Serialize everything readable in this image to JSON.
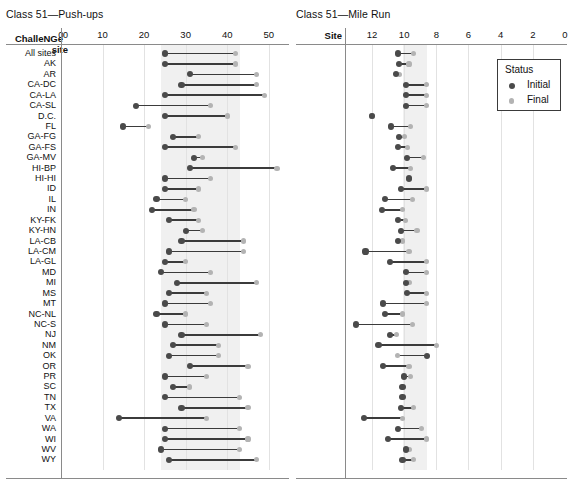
{
  "chart_data": [
    {
      "type": "dumbbell",
      "title": "Class 51—Push-ups",
      "ylabel": "ChalleNGe site",
      "xlabel": "",
      "xticks": [
        0,
        10,
        20,
        30,
        40,
        50
      ],
      "xlim": [
        0,
        55
      ],
      "reversed": false,
      "band": [
        24,
        43
      ],
      "grid": true,
      "legend": {
        "position": "none"
      },
      "series": [
        {
          "name": "Initial",
          "color": "#4a4a4a"
        },
        {
          "name": "Final",
          "color": "#b3b3b3"
        }
      ],
      "categories": [
        "All sites",
        "AK",
        "AR",
        "CA-DC",
        "CA-LA",
        "CA-SL",
        "D.C.",
        "FL",
        "GA-FG",
        "GA-FS",
        "GA-MV",
        "HI-BP",
        "HI-HI",
        "ID",
        "IL",
        "IN",
        "KY-FK",
        "KY-HN",
        "LA-CB",
        "LA-CM",
        "LA-GL",
        "MD",
        "MI",
        "MS",
        "MT",
        "NC-NL",
        "NC-S",
        "NJ",
        "NM",
        "OK",
        "OR",
        "PR",
        "SC",
        "TN",
        "TX",
        "VA",
        "WA",
        "WI",
        "WV",
        "WY"
      ],
      "initial": [
        25,
        25,
        31,
        29,
        25,
        18,
        25,
        15,
        27,
        25,
        32,
        31,
        25,
        25,
        23,
        22,
        26,
        30,
        29,
        26,
        25,
        24,
        28,
        26,
        25,
        23,
        25,
        29,
        27,
        26,
        31,
        25,
        27,
        25,
        29,
        14,
        25,
        25,
        24,
        26
      ],
      "final": [
        42,
        42,
        47,
        47,
        49,
        36,
        40,
        21,
        33,
        42,
        34,
        52,
        36,
        33,
        30,
        32,
        33,
        34,
        44,
        44,
        30,
        36,
        47,
        35,
        36,
        30,
        35,
        48,
        38,
        38,
        45,
        35,
        31,
        43,
        45,
        35,
        43,
        45,
        43,
        47
      ]
    },
    {
      "type": "dumbbell",
      "title": "Class 51—Mile Run",
      "ylabel": "Site",
      "xlabel": "",
      "xticks": [
        12,
        10,
        8,
        6,
        4,
        2,
        0
      ],
      "xlim": [
        13,
        0
      ],
      "reversed": true,
      "band": [
        10.1,
        8.6
      ],
      "grid": true,
      "legend": {
        "position": "top-right",
        "title": "Status",
        "items": [
          "Initial",
          "Final"
        ]
      },
      "categories": [
        "All sites",
        "AK",
        "AR",
        "CA-DC",
        "CA-LA",
        "CA-SL",
        "D.C.",
        "FL",
        "GA-FG",
        "GA-FS",
        "GA-MV",
        "HI-BP",
        "HI-HI",
        "ID",
        "IL",
        "IN",
        "KY-FK",
        "KY-HN",
        "LA-CB",
        "LA-CM",
        "LA-GL",
        "MD",
        "MI",
        "MS",
        "MT",
        "NC-NL",
        "NC-S",
        "NJ",
        "NM",
        "OK",
        "OR",
        "PR",
        "SC",
        "TN",
        "TX",
        "VA",
        "WA",
        "WI",
        "WV",
        "WY"
      ],
      "initial": [
        10.4,
        10.3,
        10.5,
        9.9,
        9.9,
        9.9,
        12.0,
        10.8,
        10.3,
        10.4,
        9.8,
        10.7,
        9.7,
        10.2,
        11.2,
        11.4,
        10.4,
        10.2,
        10.4,
        12.4,
        10.9,
        9.9,
        9.9,
        9.8,
        11.3,
        11.2,
        13.0,
        10.9,
        11.6,
        8.6,
        11.3,
        10.0,
        10.1,
        10.1,
        10.2,
        12.5,
        10.4,
        11.0,
        9.9,
        10.1,
        9.9
      ],
      "final": [
        9.4,
        9.7,
        10.3,
        8.6,
        8.6,
        8.6,
        12.0,
        9.6,
        10.0,
        9.8,
        8.8,
        9.6,
        9.7,
        8.6,
        9.5,
        10.1,
        9.9,
        9.2,
        10.1,
        9.7,
        8.6,
        8.6,
        9.7,
        8.6,
        8.6,
        10.1,
        9.5,
        10.5,
        8.0,
        10.4,
        9.7,
        9.6,
        10.1,
        10.1,
        9.4,
        10.1,
        8.9,
        8.6,
        9.7,
        9.4,
        9.3
      ]
    }
  ],
  "left_panel": {
    "title": "Class 51—Push-ups",
    "head_label": "ChalleNGe site",
    "head_line1": "ChalleNGe",
    "head_line2": "site",
    "head_sup": "0",
    "ticks": [
      "0",
      "10",
      "20",
      "30",
      "40",
      "50"
    ]
  },
  "right_panel": {
    "title": "Class 51—Mile Run",
    "head_label": "Site",
    "ticks": [
      "12",
      "10",
      "8",
      "6",
      "4",
      "2",
      "0"
    ]
  },
  "legend": {
    "title": "Status",
    "items": [
      {
        "label": "Initial",
        "color": "#4a4a4a"
      },
      {
        "label": "Final",
        "color": "#b3b3b3"
      }
    ]
  },
  "rows": [
    "All sites",
    "AK",
    "AR",
    "CA-DC",
    "CA-LA",
    "CA-SL",
    "D.C.",
    "FL",
    "GA-FG",
    "GA-FS",
    "GA-MV",
    "HI-BP",
    "HI-HI",
    "ID",
    "IL",
    "IN",
    "KY-FK",
    "KY-HN",
    "LA-CB",
    "LA-CM",
    "LA-GL",
    "MD",
    "MI",
    "MS",
    "MT",
    "NC-NL",
    "NC-S",
    "NJ",
    "NM",
    "OK",
    "OR",
    "PR",
    "SC",
    "TN",
    "TX",
    "VA",
    "WA",
    "WI",
    "WV",
    "WY"
  ]
}
